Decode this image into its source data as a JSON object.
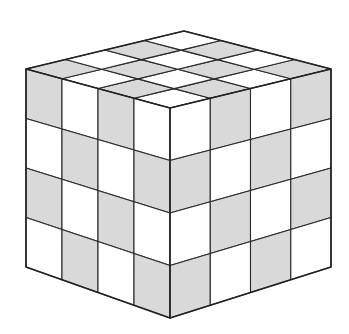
{
  "figure": {
    "grid_size": 4,
    "colors": {
      "light": "#ffffff",
      "dark": "#d9d9d9",
      "line": "#2a2a2a"
    },
    "faces": {
      "top": {
        "rows": [
          [
            "light",
            "dark",
            "light",
            "dark"
          ],
          [
            "dark",
            "light",
            "dark",
            "light"
          ],
          [
            "light",
            "dark",
            "light",
            "dark"
          ],
          [
            "dark",
            "light",
            "dark",
            "light"
          ]
        ]
      },
      "left": {
        "rows": [
          [
            "dark",
            "light",
            "dark",
            "light"
          ],
          [
            "light",
            "dark",
            "light",
            "dark"
          ],
          [
            "dark",
            "light",
            "dark",
            "light"
          ],
          [
            "light",
            "dark",
            "light",
            "dark"
          ]
        ]
      },
      "right": {
        "rows": [
          [
            "light",
            "dark",
            "light",
            "dark"
          ],
          [
            "dark",
            "light",
            "dark",
            "light"
          ],
          [
            "light",
            "dark",
            "light",
            "dark"
          ],
          [
            "dark",
            "light",
            "dark",
            "light"
          ]
        ]
      }
    }
  }
}
